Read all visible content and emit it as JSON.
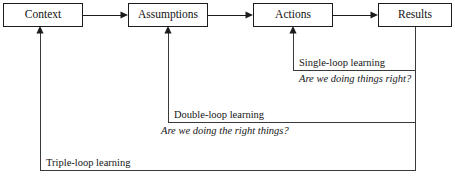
{
  "diagram": {
    "background_color": "#ffffff",
    "line_color": "#1c1c1c",
    "text_color": "#151515",
    "nodes": [
      {
        "id": "context",
        "label": "Context",
        "x": 3,
        "y": 3,
        "w": 80,
        "h": 24
      },
      {
        "id": "assumptions",
        "label": "Assumptions",
        "x": 128,
        "y": 3,
        "w": 80,
        "h": 24
      },
      {
        "id": "actions",
        "label": "Actions",
        "x": 253,
        "y": 3,
        "w": 80,
        "h": 24
      },
      {
        "id": "results",
        "label": "Results",
        "x": 378,
        "y": 3,
        "w": 74,
        "h": 24
      }
    ],
    "flow_arrows": [
      {
        "id": "context-to-assumptions",
        "from": "context",
        "to": "assumptions"
      },
      {
        "id": "assumptions-to-actions",
        "from": "assumptions",
        "to": "actions"
      },
      {
        "id": "actions-to-results",
        "from": "actions",
        "to": "results"
      }
    ],
    "loops": [
      {
        "id": "single-loop",
        "title": "Single-loop learning",
        "question": "Are we doing things right?",
        "title_x": 299,
        "title_y": 66,
        "question_x": 299,
        "question_y": 82,
        "rule_y": 70,
        "rule_x1": 293,
        "rule_x2": 415,
        "source_node": "results",
        "target_node": "actions"
      },
      {
        "id": "double-loop",
        "title": "Double-loop learning",
        "question": "Are we doing the right things?",
        "title_x": 174,
        "title_y": 118,
        "question_x": 161,
        "question_y": 134,
        "rule_y": 122,
        "rule_x1": 168,
        "rule_x2": 415,
        "source_node": "results",
        "target_node": "assumptions"
      },
      {
        "id": "triple-loop",
        "title": "Triple-loop learning",
        "question": "",
        "title_x": 46,
        "title_y": 166,
        "rule_y": 170,
        "rule_x1": 40,
        "rule_x2": 415,
        "source_node": "results",
        "target_node": "context"
      }
    ],
    "geometry": {
      "box_center_y": 15,
      "results_stem_x": 415,
      "single_riser_x": 293,
      "double_riser_x": 168,
      "triple_riser_x": 40
    }
  }
}
